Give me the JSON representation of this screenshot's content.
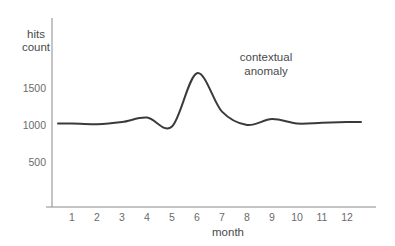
{
  "chart_data": {
    "type": "line",
    "title": "",
    "xlabel": "month",
    "ylabel": "hits count",
    "ylabel_lines": [
      "hits",
      "count"
    ],
    "x": [
      1,
      2,
      3,
      4,
      5,
      6,
      7,
      8,
      9,
      10,
      11,
      12
    ],
    "categories": [
      "1",
      "2",
      "3",
      "4",
      "5",
      "6",
      "7",
      "8",
      "9",
      "10",
      "11",
      "12"
    ],
    "values": [
      1020,
      1010,
      1040,
      1100,
      980,
      1700,
      1180,
      1000,
      1080,
      1020,
      1030,
      1040
    ],
    "series": [
      {
        "name": "hits count",
        "values": [
          1020,
          1010,
          1040,
          1100,
          980,
          1700,
          1180,
          1000,
          1080,
          1020,
          1030,
          1040
        ]
      }
    ],
    "ylim": [
      0,
      1900
    ],
    "xlim": [
      0.3,
      12.8
    ],
    "yticks": [
      500,
      1000,
      1500
    ],
    "ytick_labels": [
      "500",
      "1000",
      "1500"
    ],
    "xticks": [
      1,
      2,
      3,
      4,
      5,
      6,
      7,
      8,
      9,
      10,
      11,
      12
    ],
    "grid": false,
    "legend": "none",
    "line_color": "#3a3a3a",
    "axis_color": "#8a8a8a",
    "annotations": [
      {
        "text": "contextual anomaly",
        "lines": [
          "contextual",
          "anomaly"
        ],
        "target_x": 6,
        "target_y": 1700
      }
    ]
  },
  "axes": {
    "y_label_line1": "hits",
    "y_label_line2": "count",
    "x_label": "month",
    "yticks": [
      {
        "label": "1500"
      },
      {
        "label": "1000"
      },
      {
        "label": "500"
      }
    ],
    "xticks": [
      {
        "label": "1"
      },
      {
        "label": "2"
      },
      {
        "label": "3"
      },
      {
        "label": "4"
      },
      {
        "label": "5"
      },
      {
        "label": "6"
      },
      {
        "label": "7"
      },
      {
        "label": "8"
      },
      {
        "label": "9"
      },
      {
        "label": "10"
      },
      {
        "label": "11"
      },
      {
        "label": "12"
      }
    ]
  },
  "annotation": {
    "line1": "contextual",
    "line2": "anomaly"
  },
  "colors": {
    "line": "#3a3a3a",
    "axis": "#8a8a8a",
    "text": "#5a5a5a",
    "background": "#ffffff"
  }
}
